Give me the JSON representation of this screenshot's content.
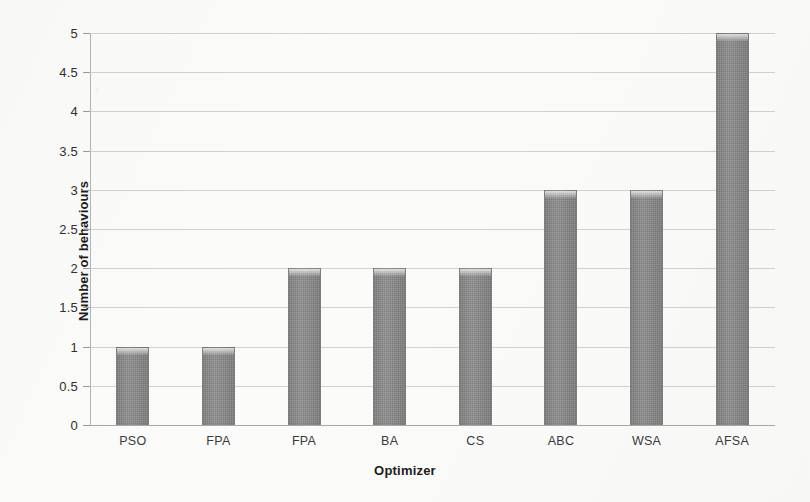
{
  "chart_data": {
    "type": "bar",
    "title": "",
    "categories": [
      "PSO",
      "FPA",
      "FPA",
      "BA",
      "CS",
      "ABC",
      "WSA",
      "AFSA"
    ],
    "values": [
      1,
      1,
      2,
      2,
      2,
      3,
      3,
      5
    ],
    "xlabel": "Optimizer",
    "ylabel": "Number of behaviours",
    "ylim": [
      0,
      5
    ],
    "ytick_labels": [
      "0",
      "0.5",
      "1",
      "1.5",
      "2",
      "2.5",
      "3",
      "3.5",
      "4",
      "4.5",
      "5"
    ],
    "ytick_values": [
      0,
      0.5,
      1,
      1.5,
      2,
      2.5,
      3,
      3.5,
      4,
      4.5,
      5
    ],
    "grid": true,
    "legend": false,
    "legend_position": "none",
    "bar_color": "#8b8b8b",
    "gridline_color": "#c9c9c7",
    "background_color": "#fbfbfa"
  }
}
